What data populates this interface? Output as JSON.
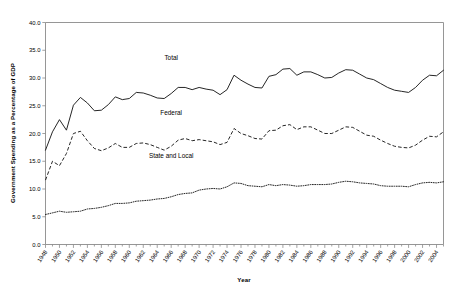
{
  "chart_data": {
    "type": "line",
    "title": "",
    "xlabel": "Year",
    "ylabel": "Government Spending as a Percentage of GDP",
    "xlim": [
      1948,
      2005
    ],
    "ylim": [
      0.0,
      40.0
    ],
    "yticks": [
      "0.0",
      "5.0",
      "10.0",
      "15.0",
      "20.0",
      "25.0",
      "30.0",
      "35.0",
      "40.0"
    ],
    "ytick_values": [
      0.0,
      5.0,
      10.0,
      15.0,
      20.0,
      25.0,
      30.0,
      35.0,
      40.0
    ],
    "xticks": [
      "1948",
      "1950",
      "1952",
      "1954",
      "1956",
      "1958",
      "1960",
      "1962",
      "1964",
      "1966",
      "1968",
      "1970",
      "1972",
      "1974",
      "1976",
      "1978",
      "1980",
      "1982",
      "1984",
      "1986",
      "1988",
      "1990",
      "1992",
      "1994",
      "1996",
      "1998",
      "2000",
      "2002",
      "2004"
    ],
    "xtick_values": [
      1948,
      1950,
      1952,
      1954,
      1956,
      1958,
      1960,
      1962,
      1964,
      1966,
      1968,
      1970,
      1972,
      1974,
      1976,
      1978,
      1980,
      1982,
      1984,
      1986,
      1988,
      1990,
      1992,
      1994,
      1996,
      1998,
      2000,
      2002,
      2004
    ],
    "minor_xticks_step": 1,
    "grid": false,
    "legend_position": "inline-annotations",
    "x": [
      1948,
      1949,
      1950,
      1951,
      1952,
      1953,
      1954,
      1955,
      1956,
      1957,
      1958,
      1959,
      1960,
      1961,
      1962,
      1963,
      1964,
      1965,
      1966,
      1967,
      1968,
      1969,
      1970,
      1971,
      1972,
      1973,
      1974,
      1975,
      1976,
      1977,
      1978,
      1979,
      1980,
      1981,
      1982,
      1983,
      1984,
      1985,
      1986,
      1987,
      1988,
      1989,
      1990,
      1991,
      1992,
      1993,
      1994,
      1995,
      1996,
      1997,
      1998,
      1999,
      2000,
      2001,
      2002,
      2003,
      2004,
      2005
    ],
    "series": [
      {
        "name": "Total",
        "style": "solid",
        "label_x": 1966,
        "label_y": 33.3,
        "values": [
          17.0,
          20.3,
          22.5,
          20.6,
          25.1,
          26.5,
          25.5,
          24.1,
          24.2,
          25.2,
          26.6,
          26.1,
          26.3,
          27.4,
          27.3,
          26.9,
          26.4,
          26.3,
          27.2,
          28.3,
          28.3,
          27.9,
          28.3,
          28.0,
          27.8,
          27.0,
          27.9,
          30.5,
          29.6,
          28.9,
          28.3,
          28.2,
          30.3,
          30.6,
          31.6,
          31.7,
          30.5,
          31.1,
          31.1,
          30.6,
          30.0,
          30.1,
          30.9,
          31.5,
          31.4,
          30.7,
          30.0,
          29.7,
          29.0,
          28.3,
          27.8,
          27.6,
          27.4,
          28.3,
          29.6,
          30.5,
          30.4,
          31.4
        ]
      },
      {
        "name": "Federal",
        "style": "dashed",
        "label_x": 1966,
        "label_y": 23.3,
        "values": [
          11.6,
          15.0,
          14.2,
          16.4,
          20.0,
          20.4,
          18.7,
          17.3,
          16.9,
          17.4,
          18.2,
          17.5,
          17.5,
          18.2,
          18.3,
          18.0,
          17.5,
          17.0,
          17.7,
          18.8,
          19.1,
          18.7,
          18.9,
          18.7,
          18.5,
          18.0,
          18.4,
          20.9,
          20.0,
          19.6,
          19.1,
          19.0,
          20.5,
          20.6,
          21.4,
          21.6,
          20.7,
          21.2,
          21.2,
          20.6,
          20.0,
          20.0,
          20.6,
          21.2,
          21.1,
          20.4,
          19.7,
          19.5,
          18.8,
          18.2,
          17.7,
          17.5,
          17.4,
          17.9,
          18.8,
          19.5,
          19.4,
          20.3
        ]
      },
      {
        "name": "State and Local",
        "style": "dotted",
        "label_x": 1966,
        "label_y": 15.6,
        "values": [
          5.4,
          5.7,
          6.0,
          5.8,
          5.9,
          6.0,
          6.4,
          6.5,
          6.7,
          7.0,
          7.4,
          7.4,
          7.5,
          7.8,
          7.9,
          8.0,
          8.2,
          8.3,
          8.6,
          9.0,
          9.2,
          9.3,
          9.8,
          10.0,
          10.1,
          10.0,
          10.4,
          11.1,
          11.0,
          10.6,
          10.5,
          10.4,
          10.8,
          10.6,
          10.8,
          10.7,
          10.5,
          10.6,
          10.8,
          10.8,
          10.8,
          10.9,
          11.2,
          11.4,
          11.3,
          11.1,
          11.0,
          10.9,
          10.6,
          10.5,
          10.5,
          10.5,
          10.4,
          10.8,
          11.1,
          11.2,
          11.1,
          11.3
        ]
      }
    ]
  }
}
